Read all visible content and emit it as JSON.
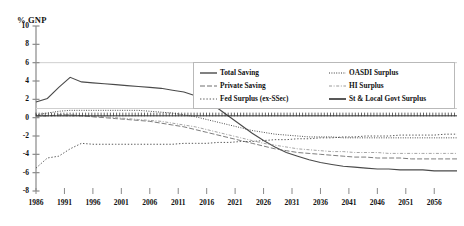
{
  "chart_data": {
    "type": "line",
    "title": "",
    "xlabel": "",
    "ylabel": "% GNP",
    "ylim": [
      -8,
      10
    ],
    "xlim": [
      1986,
      2060
    ],
    "grid": false,
    "legend_position": "top-right",
    "ytick_labels": [
      "10",
      "8",
      "6",
      "4",
      "2",
      "0",
      "-2",
      "-4",
      "-6",
      "-8"
    ],
    "ytick_values": [
      10,
      8,
      6,
      4,
      2,
      0,
      -2,
      -4,
      -6,
      -8
    ],
    "xtick_labels": [
      "1986",
      "1991",
      "1996",
      "2001",
      "2006",
      "2011",
      "2016",
      "2021",
      "2026",
      "2031",
      "2036",
      "2041",
      "2046",
      "2051",
      "2056"
    ],
    "xtick_values": [
      1986,
      1991,
      1996,
      2001,
      2006,
      2011,
      2016,
      2021,
      2026,
      2031,
      2036,
      2041,
      2046,
      2051,
      2056
    ],
    "x": [
      1986,
      1988,
      1990,
      1992,
      1994,
      1996,
      1998,
      2000,
      2002,
      2004,
      2006,
      2008,
      2010,
      2012,
      2014,
      2016,
      2018,
      2020,
      2022,
      2024,
      2026,
      2028,
      2030,
      2032,
      2034,
      2036,
      2038,
      2040,
      2042,
      2044,
      2046,
      2048,
      2050,
      2052,
      2054,
      2056,
      2058,
      2060
    ],
    "series": [
      {
        "name": "Total Saving",
        "style": "solid",
        "color": "#4a4a4a",
        "values": [
          1.7,
          2.1,
          3.3,
          4.4,
          3.9,
          3.8,
          3.7,
          3.6,
          3.5,
          3.4,
          3.3,
          3.2,
          3.0,
          2.8,
          2.4,
          1.8,
          1.0,
          0.1,
          -0.8,
          -1.7,
          -2.5,
          -3.2,
          -3.8,
          -4.2,
          -4.6,
          -4.9,
          -5.1,
          -5.3,
          -5.4,
          -5.5,
          -5.6,
          -5.6,
          -5.7,
          -5.7,
          -5.7,
          -5.8,
          -5.8,
          -5.8
        ]
      },
      {
        "name": "Private Saving",
        "style": "dashed",
        "color": "#6e6e6e",
        "values": [
          0.2,
          0.2,
          0.3,
          0.3,
          0.2,
          0.1,
          0.0,
          -0.1,
          -0.2,
          -0.3,
          -0.4,
          -0.6,
          -0.8,
          -1.0,
          -1.3,
          -1.6,
          -1.9,
          -2.2,
          -2.5,
          -2.8,
          -3.1,
          -3.4,
          -3.6,
          -3.8,
          -3.9,
          -4.0,
          -4.1,
          -4.2,
          -4.3,
          -4.3,
          -4.4,
          -4.4,
          -4.4,
          -4.5,
          -4.5,
          -4.5,
          -4.5,
          -4.5
        ]
      },
      {
        "name": "Fed Surplus (ex-SSec)",
        "style": "dotted",
        "color": "#5a5a5a",
        "values": [
          -5.5,
          -4.4,
          -4.2,
          -3.4,
          -2.8,
          -2.9,
          -2.9,
          -2.9,
          -2.9,
          -2.9,
          -2.9,
          -2.9,
          -2.9,
          -2.8,
          -2.8,
          -2.8,
          -2.7,
          -2.7,
          -2.6,
          -2.6,
          -2.5,
          -2.4,
          -2.4,
          -2.3,
          -2.3,
          -2.2,
          -2.2,
          -2.1,
          -2.1,
          -2.0,
          -2.0,
          -2.0,
          -1.9,
          -1.9,
          -1.9,
          -1.9,
          -1.8,
          -1.8
        ]
      },
      {
        "name": "OASDI Surplus",
        "style": "dotted-dense",
        "color": "#3d3d3d",
        "values": [
          0.3,
          0.5,
          0.7,
          0.8,
          0.8,
          0.8,
          0.8,
          0.8,
          0.8,
          0.8,
          0.7,
          0.6,
          0.5,
          0.3,
          0.1,
          -0.2,
          -0.5,
          -0.8,
          -1.1,
          -1.4,
          -1.6,
          -1.8,
          -1.9,
          -2.0,
          -2.1,
          -2.1,
          -2.1,
          -2.2,
          -2.2,
          -2.2,
          -2.2,
          -2.2,
          -2.2,
          -2.2,
          -2.2,
          -2.2,
          -2.2,
          -2.2
        ]
      },
      {
        "name": "HI Surplus",
        "style": "dash-dot",
        "color": "#9a9a9a",
        "values": [
          0.1,
          0.2,
          0.2,
          0.2,
          0.2,
          0.1,
          0.1,
          0.0,
          -0.1,
          -0.2,
          -0.3,
          -0.4,
          -0.6,
          -0.8,
          -1.0,
          -1.3,
          -1.6,
          -1.9,
          -2.2,
          -2.5,
          -2.8,
          -3.0,
          -3.2,
          -3.4,
          -3.5,
          -3.6,
          -3.7,
          -3.7,
          -3.8,
          -3.8,
          -3.8,
          -3.9,
          -3.9,
          -3.9,
          -3.9,
          -3.9,
          -3.9,
          -3.9
        ]
      },
      {
        "name": "St & Local Govt Surplus",
        "style": "hatched",
        "color": "#2f2f2f",
        "values": [
          0.2,
          0.2,
          0.2,
          0.2,
          0.2,
          0.2,
          0.2,
          0.2,
          0.2,
          0.2,
          0.2,
          0.2,
          0.2,
          0.2,
          0.2,
          0.2,
          0.2,
          0.2,
          0.2,
          0.2,
          0.2,
          0.2,
          0.2,
          0.2,
          0.2,
          0.2,
          0.2,
          0.2,
          0.2,
          0.2,
          0.2,
          0.2,
          0.2,
          0.2,
          0.2,
          0.2,
          0.2,
          0.2
        ]
      }
    ]
  },
  "legend": {
    "left_items": [
      {
        "label": "Total Saving",
        "style": "solid"
      },
      {
        "label": "Private Saving",
        "style": "dashed"
      },
      {
        "label": "Fed Surplus (ex-SSec)",
        "style": "dotted"
      }
    ],
    "right_items": [
      {
        "label": "OASDI Surplus",
        "style": "dotted-dense"
      },
      {
        "label": "HI Surplus",
        "style": "dash-dot"
      },
      {
        "label": "St & Local Govt Surplus",
        "style": "hatched"
      }
    ]
  }
}
